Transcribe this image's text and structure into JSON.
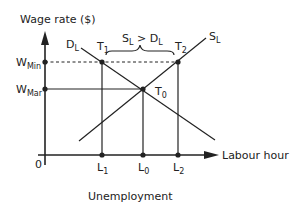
{
  "diagram": {
    "y_axis_label": "Wage rate ($)",
    "x_axis_label": "Labour hour",
    "origin_label": "0",
    "caption": "Unemployment",
    "wage_levels": [
      {
        "main": "W",
        "sub": "Min"
      },
      {
        "main": "W",
        "sub": "Mar"
      }
    ],
    "curves": {
      "demand": {
        "main": "D",
        "sub": "L"
      },
      "supply": {
        "main": "S",
        "sub": "L"
      }
    },
    "points": {
      "t1": {
        "main": "T",
        "sub": "1"
      },
      "t2": {
        "main": "T",
        "sub": "2"
      },
      "t0": {
        "main": "T",
        "sub": "0"
      }
    },
    "quantities": {
      "l1": {
        "main": "L",
        "sub": "1"
      },
      "l0": {
        "main": "L",
        "sub": "0"
      },
      "l2": {
        "main": "L",
        "sub": "2"
      }
    },
    "surplus_label": {
      "s": "S",
      "s_sub": "L",
      "op": " > ",
      "d": "D",
      "d_sub": "L"
    },
    "colors": {
      "line": "#222222",
      "background": "#ffffff"
    }
  }
}
